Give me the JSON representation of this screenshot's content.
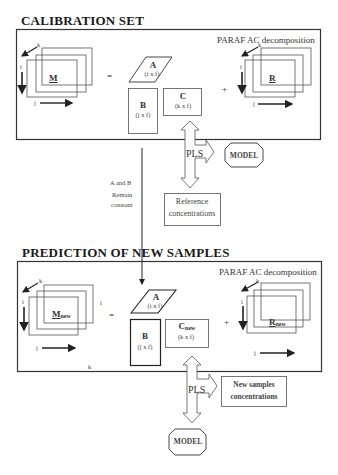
{
  "calibration": {
    "title": "CALIBRATION SET",
    "method_label": "PARAF AC decomposition",
    "tensor_M": {
      "label": "M",
      "axis_i": "i",
      "axis_j": "j",
      "axis_k": "k"
    },
    "equals": "=",
    "plus": "+",
    "matrix_A": {
      "label": "A",
      "dims": "(i x f)"
    },
    "matrix_B": {
      "label": "B",
      "dims": "(j x f)"
    },
    "matrix_C": {
      "label": "C",
      "dims": "(k x f)"
    },
    "residual_R": {
      "label": "R",
      "axis_i": "i",
      "axis_j": "j",
      "axis_k": "k"
    },
    "pls_label": "PLS",
    "model_label": "MODEL",
    "reference_box": {
      "line1": "Reference",
      "line2": "concentrations"
    }
  },
  "connector": {
    "line1": "A and B",
    "line2": "Remain",
    "line3": "constant"
  },
  "prediction": {
    "title": "PREDICTION OF NEW SAMPLES",
    "method_label": "PARAF AC decomposition",
    "tensor_M": {
      "label": "M",
      "sub": "new",
      "axis_i": "i",
      "axis_j": "j",
      "axis_k": "k",
      "extra_i": "i",
      "extra_k": "k"
    },
    "equals": "=",
    "plus": "+",
    "matrix_A": {
      "label": "A",
      "dims": "(i x f)"
    },
    "matrix_B": {
      "label": "B",
      "dims": "(j x f)"
    },
    "matrix_C": {
      "label": "C",
      "sub": "new",
      "dims": "(k x f)"
    },
    "residual_R": {
      "label": "R",
      "sub": "new",
      "axis_i": "i",
      "axis_j": "j",
      "axis_k": "k"
    },
    "pls_label": "PLS",
    "model_label": "MODEL",
    "output_box": {
      "line1": "New samples",
      "line2": "concentrations"
    }
  }
}
